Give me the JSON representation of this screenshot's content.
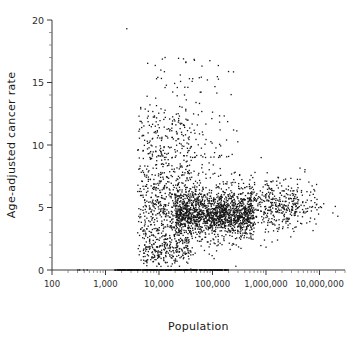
{
  "chart_data": {
    "type": "scatter",
    "title": "",
    "xlabel": "Population",
    "ylabel": "Age-adjusted cancer rate",
    "xscale": "log",
    "yscale": "linear",
    "xlim": [
      100,
      30000000
    ],
    "ylim": [
      0,
      20
    ],
    "grid": false,
    "legend": null,
    "x_tick_labels": [
      "100",
      "1,000",
      "10,000",
      "100,000",
      "1,000,000",
      "10,000,000"
    ],
    "x_tick_values": [
      100,
      1000,
      10000,
      100000,
      1000000,
      10000000
    ],
    "y_tick_labels": [
      "0",
      "5",
      "10",
      "15",
      "20"
    ],
    "y_tick_values": [
      0,
      5,
      10,
      15,
      20
    ],
    "y_minor_step": 1,
    "marker": {
      "shape": "square",
      "size_px": 1.3,
      "color": "#151515"
    },
    "n_points_approx": 2600,
    "point_clusters": [
      {
        "name": "zero-rate-band",
        "x_range": [
          1500,
          200000
        ],
        "y_value": 0,
        "count": 330
      },
      {
        "name": "zero-rate-isolated",
        "x_range": [
          300,
          520
        ],
        "y_value": 0,
        "count": 4
      },
      {
        "name": "main-core",
        "x_range": [
          20000,
          600000
        ],
        "y_range": [
          2.5,
          6.5
        ],
        "count": 1250
      },
      {
        "name": "small-pop-spread",
        "x_range": [
          4000,
          40000
        ],
        "y_range": [
          1.0,
          13.0
        ],
        "count": 700
      },
      {
        "name": "upper-tail",
        "x_range": [
          6000,
          300000
        ],
        "y_range": [
          9.0,
          17.0
        ],
        "count": 140
      },
      {
        "name": "large-pop-tail",
        "x_range": [
          600000,
          9000000
        ],
        "y_range": [
          3.0,
          8.0
        ],
        "count": 170
      },
      {
        "name": "far-right-outliers",
        "x_range": [
          9000000,
          25000000
        ],
        "y_range": [
          4.2,
          5.5
        ],
        "count": 6
      }
    ],
    "notable_outliers": [
      {
        "x": 2500,
        "y": 19.3
      },
      {
        "x": 13000,
        "y": 17.0
      },
      {
        "x": 25000,
        "y": 15.6
      },
      {
        "x": 9000,
        "y": 15.3
      },
      {
        "x": 22000,
        "y": 14.6
      },
      {
        "x": 30000,
        "y": 14.0
      },
      {
        "x": 6000,
        "y": 13.9
      },
      {
        "x": 22000000,
        "y": 4.3
      },
      {
        "x": 12000000,
        "y": 5.3
      }
    ]
  }
}
